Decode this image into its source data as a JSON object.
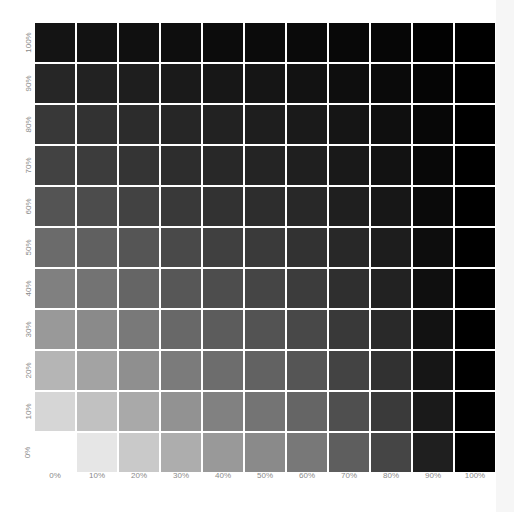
{
  "chart_data": {
    "type": "heatmap",
    "title": "",
    "xlabel": "",
    "ylabel": "",
    "x_tick_labels": [
      "0%",
      "10%",
      "20%",
      "30%",
      "40%",
      "50%",
      "60%",
      "70%",
      "80%",
      "90%",
      "100%"
    ],
    "y_tick_labels_top_to_bottom": [
      "100%",
      "90%",
      "80%",
      "70%",
      "60%",
      "50%",
      "40%",
      "30%",
      "20%",
      "10%",
      "0%"
    ],
    "grid": true,
    "legend": "none",
    "column_brightness": [
      1.0,
      0.9,
      0.79,
      0.68,
      0.6,
      0.54,
      0.47,
      0.37,
      0.27,
      0.12,
      0.0
    ],
    "row_brightness_top_to_bottom": [
      0.08,
      0.15,
      0.22,
      0.26,
      0.33,
      0.42,
      0.5,
      0.6,
      0.71,
      0.84,
      1.0
    ]
  },
  "colors": {
    "background": "#ffffff",
    "gridline": "#ffffff",
    "label": "#8a8a8a",
    "right_strip": "#f6f6f6"
  }
}
